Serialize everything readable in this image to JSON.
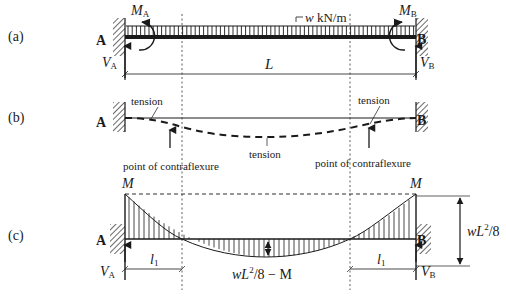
{
  "panels": {
    "a": {
      "tag": "(a)",
      "load_label_w": "w",
      "load_label_unit": " kN/m",
      "moment_A_main": "M",
      "moment_A_sub": "A",
      "moment_B_main": "M",
      "moment_B_sub": "B",
      "reaction_A_main": "V",
      "reaction_A_sub": "A",
      "reaction_B_main": "V",
      "reaction_B_sub": "B",
      "support_A": "A",
      "support_B": "B",
      "span_label": "L"
    },
    "b": {
      "tag": "(b)",
      "support_A": "A",
      "support_B": "B",
      "tension_left": "tension",
      "tension_right": "tension",
      "tension_mid": "tension",
      "contraflexure_left": "point of contraflexure",
      "contraflexure_right": "point of contraflexure"
    },
    "c": {
      "tag": "(c)",
      "moment_left": "M",
      "moment_right": "M",
      "support_A": "A",
      "support_B": "B",
      "reaction_A_main": "V",
      "reaction_A_sub": "A",
      "reaction_B_main": "V",
      "reaction_B_sub": "B",
      "length_left_main": "l",
      "length_left_sub": "1",
      "length_right_main": "l",
      "length_right_sub": "1",
      "mid_label_pre": "wL",
      "mid_label_sup": "2",
      "mid_label_post": "/8 − M",
      "total_label_pre": "wL",
      "total_label_sup": "2",
      "total_label_post": "/8"
    }
  },
  "colors": {
    "ink": "#1a1a1a",
    "background": "#ffffff"
  }
}
